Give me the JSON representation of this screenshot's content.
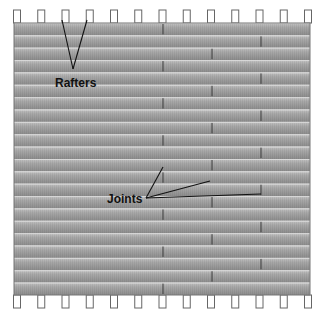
{
  "diagram": {
    "labels": {
      "rafters": "Rafters",
      "joints": "Joints"
    },
    "board_color_light": "#b4b4b4",
    "board_color_dark": "#8a8a8a",
    "joint_color": "#3a3a3a",
    "rafter_count": 13,
    "board_row_count": 22,
    "joint_columns_x": [
      163,
      212,
      261
    ]
  }
}
